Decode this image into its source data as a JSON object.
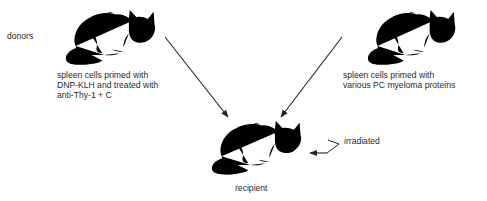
{
  "diagram": {
    "row_label": "donors",
    "left_donor": {
      "caption_lines": [
        "spleen cells primed with",
        "DNP-KLH and treated with",
        "anti-Thy-1 + C"
      ]
    },
    "right_donor": {
      "caption_lines": [
        "spleen cells primed with",
        "various PC myeloma proteins"
      ]
    },
    "recipient": {
      "caption": "recipient",
      "treatment": "irradiated"
    },
    "colors": {
      "line": "#222222",
      "background": "#ffffff"
    }
  }
}
